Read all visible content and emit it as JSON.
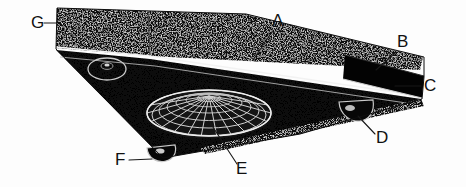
{
  "figure": {
    "kind": "patent-line-drawing",
    "background_color": "#fdfdfd",
    "ink_color": "#111111",
    "body_fill": "#0c0c0c",
    "highlight_color": "#efefef",
    "aft_block_fill": "#040404"
  },
  "callouts": [
    {
      "id": "G",
      "label": "G",
      "name": "callout-g",
      "text_x": 31,
      "text_y": 28,
      "leader": "M 44 23 L 57 23",
      "target": "upper rear deck panel, port side leading corner"
    },
    {
      "id": "A",
      "label": "A",
      "name": "callout-a",
      "text_x": 272,
      "text_y": 26,
      "leader": "M 272 32 L 253 60",
      "target": "upper deck centre seam"
    },
    {
      "id": "B",
      "label": "B",
      "name": "callout-b",
      "text_x": 397,
      "text_y": 47,
      "leader": "M 396 52 L 376 70",
      "target": "aft vertical block face"
    },
    {
      "id": "C",
      "label": "C",
      "name": "callout-c",
      "text_x": 424,
      "text_y": 91,
      "leader": "M 421 86 L 395 86",
      "target": "aft block lower trailing edge"
    },
    {
      "id": "D",
      "label": "D",
      "name": "callout-d",
      "text_x": 376,
      "text_y": 143,
      "leader": "M 375 134 L 358 116",
      "target": "starboard underside pod"
    },
    {
      "id": "E",
      "label": "E",
      "name": "callout-e",
      "text_x": 236,
      "text_y": 174,
      "leader": "M 237 164 L 209 121",
      "target": "central domed grid array"
    },
    {
      "id": "F",
      "label": "F",
      "name": "callout-f",
      "text_x": 115,
      "text_y": 165,
      "leader": "M 129 160 L 152 159",
      "target": "forward underside pod"
    }
  ],
  "features": {
    "upper_deck_label": "upper rear deck",
    "main_hull_label": "main triangular hull",
    "aft_block_label": "aft block",
    "dome_array_label": "domed grid array",
    "port_port_label": "port circular port",
    "pods": [
      "forward pod",
      "starboard pod"
    ]
  }
}
